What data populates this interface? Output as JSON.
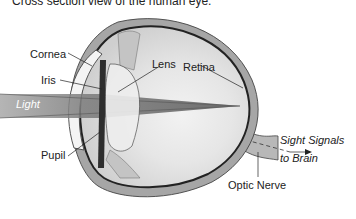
{
  "caption": "Cross section view of the human eye.",
  "labels": {
    "cornea": "Cornea",
    "iris": "Iris",
    "lens": "Lens",
    "retina": "Retina",
    "light": "Light",
    "pupil": "Pupil",
    "sight_signals": "Sight Signals",
    "to_brain": "to Brain",
    "optic_nerve": "Optic Nerve"
  },
  "colors": {
    "sclera": "#9a9a9a",
    "interior": "#dcdcdc",
    "light_beam": "#8f8f8f",
    "choroid": "#333333",
    "text": "#222222"
  }
}
